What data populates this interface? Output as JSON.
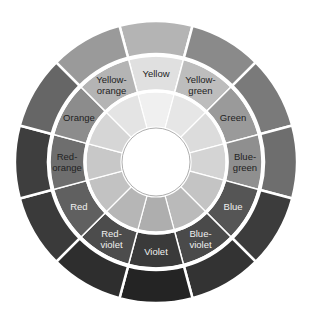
{
  "diagram": {
    "center": [
      156,
      162
    ],
    "radii": {
      "hole": 34,
      "inner": [
        35,
        70
      ],
      "labeled": [
        72,
        106
      ],
      "outer": [
        108,
        141
      ]
    },
    "segments": [
      {
        "name": "Yellow",
        "lines": [
          "Yellow"
        ],
        "inner": "#f0f0f0",
        "labeled": "#e0e0e0",
        "outer": "#b4b4b4",
        "text": "#222222"
      },
      {
        "name": "Yellow-green",
        "lines": [
          "Yellow-",
          "green"
        ],
        "inner": "#e6e6e6",
        "labeled": "#bdbdbd",
        "outer": "#8a8a8a",
        "text": "#222222"
      },
      {
        "name": "Green",
        "lines": [
          "Green"
        ],
        "inner": "#dcdcdc",
        "labeled": "#9a9a9a",
        "outer": "#7a7a7a",
        "text": "#222222"
      },
      {
        "name": "Blue-green",
        "lines": [
          "Blue-",
          "green"
        ],
        "inner": "#d4d4d4",
        "labeled": "#8f8f8f",
        "outer": "#6e6e6e",
        "text": "#222222"
      },
      {
        "name": "Blue",
        "lines": [
          "Blue"
        ],
        "inner": "#c4c4c4",
        "labeled": "#555555",
        "outer": "#3c3c3c",
        "text": "#f0f0f0"
      },
      {
        "name": "Blue-violet",
        "lines": [
          "Blue-",
          "violet"
        ],
        "inner": "#bababa",
        "labeled": "#4a4a4a",
        "outer": "#333333",
        "text": "#f0f0f0"
      },
      {
        "name": "Violet",
        "lines": [
          "Violet"
        ],
        "inner": "#aeaeae",
        "labeled": "#3a3a3a",
        "outer": "#242424",
        "text": "#f0f0f0"
      },
      {
        "name": "Red-violet",
        "lines": [
          "Red-",
          "violet"
        ],
        "inner": "#b6b6b6",
        "labeled": "#4c4c4c",
        "outer": "#2e2e2e",
        "text": "#f0f0f0"
      },
      {
        "name": "Red",
        "lines": [
          "Red"
        ],
        "inner": "#c2c2c2",
        "labeled": "#606060",
        "outer": "#3a3a3a",
        "text": "#f0f0f0"
      },
      {
        "name": "Red-orange",
        "lines": [
          "Red-",
          "orange"
        ],
        "inner": "#c8c8c8",
        "labeled": "#6e6e6e",
        "outer": "#3e3e3e",
        "text": "#222222"
      },
      {
        "name": "Orange",
        "lines": [
          "Orange"
        ],
        "inner": "#d6d6d6",
        "labeled": "#8c8c8c",
        "outer": "#666666",
        "text": "#222222"
      },
      {
        "name": "Yellow-orange",
        "lines": [
          "Yellow-",
          "orange"
        ],
        "inner": "#e4e4e4",
        "labeled": "#b4b4b4",
        "outer": "#9a9a9a",
        "text": "#222222"
      }
    ],
    "separator_color": "#ffffff"
  }
}
